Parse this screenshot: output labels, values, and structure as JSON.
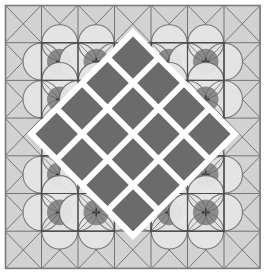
{
  "artwork": {
    "title": "Decorative Tile Quilt Pattern",
    "kind": "geometric-tiling",
    "canvas": {
      "width": 266,
      "height": 274
    }
  },
  "palette": {
    "page_background": "#ffffff",
    "light_tile": "#d2d2d2",
    "mid_field": "#b8b8b8",
    "flower_tile": "#8c8c8c",
    "flower_petal": "#e6e6e6",
    "flower_ring": "#6f6f6f",
    "diamond_fill": "#6b6b6b",
    "diamond_gap": "#ffffff",
    "grid_line": "#555555",
    "cross_line": "#666666",
    "outer_border": "#7a7a7a"
  },
  "grid": {
    "columns": 7,
    "rows": 7,
    "cell_width": 36.5,
    "cell_height": 37.7,
    "origin_x": 5,
    "origin_y": 5,
    "line_width": 1
  },
  "tiles": {
    "cross_tile_label": "x-cross-tile",
    "flower_tile_label": "four-petal-flower-tile",
    "flower_blocks": [
      {
        "label": "top-left-flower-block",
        "col": 1,
        "row": 1,
        "cols": 2,
        "rows": 2
      },
      {
        "label": "top-right-flower-block",
        "col": 4,
        "row": 1,
        "cols": 2,
        "rows": 2
      },
      {
        "label": "bottom-left-flower-block",
        "col": 1,
        "row": 4,
        "cols": 2,
        "rows": 2
      },
      {
        "label": "bottom-right-flower-block",
        "col": 4,
        "row": 4,
        "cols": 2,
        "rows": 2
      }
    ],
    "mid_field_block": {
      "label": "center-field",
      "col": 1,
      "row": 1,
      "cols": 5,
      "rows": 5
    }
  },
  "center_medallion": {
    "label": "central-diamond-medallion",
    "rotation_degrees": 45,
    "center_x": 133,
    "center_y": 134,
    "outer_size": 146,
    "border_color": "#ffffff",
    "lattice": {
      "rows": 4,
      "columns": 4,
      "count": 16,
      "cell_size": 30,
      "gap": 6,
      "fill": "#6b6b6b"
    }
  },
  "legend": {
    "cross_tile": "x-cross-tile",
    "flower_tile": "four-petal-flower-tile",
    "diamond": "lattice-diamond"
  }
}
